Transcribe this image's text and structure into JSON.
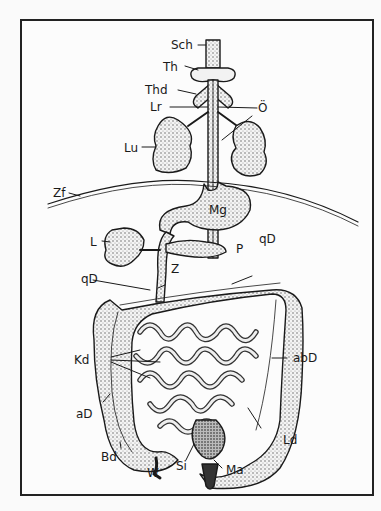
{
  "figure": {
    "labels": {
      "sch": "Sch",
      "th": "Th",
      "thd": "Thd",
      "lr": "Lr",
      "oe": "Ö",
      "lu": "Lu",
      "zf": "Zf",
      "mg": "Mg",
      "l": "L",
      "p": "P",
      "qd_right": "qD",
      "qd_left": "qD",
      "z": "Z",
      "kd": "Kd",
      "abd": "abD",
      "ad": "aD",
      "ld": "Ld",
      "bd": "Bd",
      "w": "W",
      "si": "Si",
      "ma": "Ma"
    },
    "colors": {
      "ink": "#1a1a1a",
      "paper": "#fcfcfc",
      "frame": "#222222"
    }
  }
}
